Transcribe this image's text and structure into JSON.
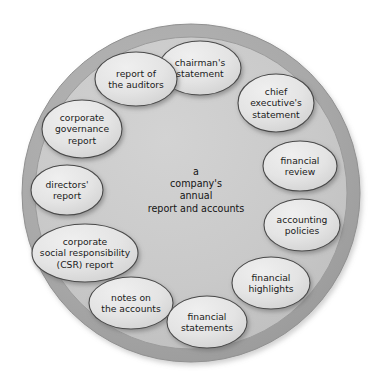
{
  "diagram": {
    "title": "a company's annual report and accounts",
    "type": "circular-wheel",
    "center": {
      "text": "a\ncompany's\nannual\nreport and accounts",
      "x": 196,
      "y": 190
    },
    "colors": {
      "background": "#ffffff",
      "outer_ring_fill": "#a8a8a8",
      "outer_ring_stroke": "#8f8f8f",
      "inner_disc_fill": "#c9c9c9",
      "inner_disc_stroke": "#9a9a9a",
      "node_fill": "#e2e2e2",
      "node_stroke": "#4a4a4a",
      "node_shadow": "#8c8c8c",
      "text": "#1a1a1a"
    },
    "geometry": {
      "circle_cx": 191,
      "circle_cy": 193,
      "outer_r": 169,
      "inner_r": 156
    },
    "nodes": [
      {
        "id": "chairmans-statement",
        "text": "chairman's\nstatement",
        "x": 200,
        "y": 68,
        "rx": 41,
        "ry": 27
      },
      {
        "id": "report-of-the-auditors",
        "text": "report of\nthe auditors",
        "x": 136,
        "y": 79,
        "rx": 41,
        "ry": 27
      },
      {
        "id": "corporate-governance-report",
        "text": "corporate\ngovernance\nreport",
        "x": 82,
        "y": 129,
        "rx": 40,
        "ry": 29
      },
      {
        "id": "directors-report",
        "text": "directors'\nreport",
        "x": 67,
        "y": 190,
        "rx": 36,
        "ry": 25
      },
      {
        "id": "csr-report",
        "text": "corporate\nsocial responsibility\n(CSR) report",
        "x": 85,
        "y": 253,
        "rx": 53,
        "ry": 29
      },
      {
        "id": "notes-on-the-accounts",
        "text": "notes on\nthe accounts",
        "x": 131,
        "y": 303,
        "rx": 42,
        "ry": 26
      },
      {
        "id": "financial-statements",
        "text": "financial\nstatements",
        "x": 207,
        "y": 322,
        "rx": 40,
        "ry": 26
      },
      {
        "id": "financial-highlights",
        "text": "financial\nhighlights",
        "x": 271,
        "y": 283,
        "rx": 39,
        "ry": 26
      },
      {
        "id": "accounting-policies",
        "text": "accounting\npolicies",
        "x": 302,
        "y": 225,
        "rx": 38,
        "ry": 26
      },
      {
        "id": "financial-review",
        "text": "financial\nreview",
        "x": 300,
        "y": 166,
        "rx": 37,
        "ry": 25
      },
      {
        "id": "chief-executives-statement",
        "text": "chief\nexecutive's\nstatement",
        "x": 276,
        "y": 103,
        "rx": 38,
        "ry": 29
      }
    ]
  }
}
